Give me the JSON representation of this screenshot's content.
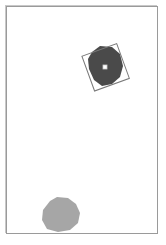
{
  "canvas": {
    "background": "#ffffff",
    "border_color": "#9a9a9a"
  },
  "objects": [
    {
      "name": "selected-blob",
      "fill": "#4a4a4a",
      "selected": true,
      "center": [
        105,
        67
      ],
      "rotation_deg": -20
    },
    {
      "name": "blob",
      "fill": "#a6a6a6",
      "selected": false,
      "center": [
        60,
        218
      ]
    }
  ],
  "selection": {
    "box_color": "#7a7a7a",
    "handle_icon": "center-handle-icon"
  }
}
